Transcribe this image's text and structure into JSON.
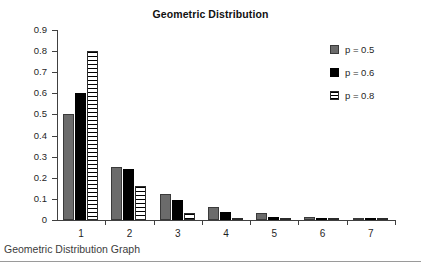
{
  "chart_data": {
    "type": "bar",
    "title": "Geometric Distribution",
    "xlabel": "",
    "ylabel": "",
    "categories": [
      "1",
      "2",
      "3",
      "4",
      "5",
      "6",
      "7"
    ],
    "series": [
      {
        "name": "p = 0.5",
        "color": "#6b6b6b",
        "pattern": "solid-gray",
        "values": [
          0.5,
          0.25,
          0.125,
          0.0625,
          0.031,
          0.016,
          0.008
        ]
      },
      {
        "name": "p = 0.6",
        "color": "#000000",
        "pattern": "solid-black",
        "values": [
          0.6,
          0.24,
          0.096,
          0.038,
          0.015,
          0.006,
          0.002
        ]
      },
      {
        "name": "p = 0.8",
        "color": "#ffffff",
        "pattern": "horizontal-stripes",
        "values": [
          0.8,
          0.16,
          0.032,
          0.0064,
          0.0013,
          0.0003,
          0.0001
        ]
      }
    ],
    "ylim": [
      0,
      0.9
    ],
    "ytick_labels": [
      "0.9",
      "0.8",
      "0.7",
      "0.6",
      "0.5",
      "0.4",
      "0.3",
      "0.2",
      "0.1",
      "0"
    ],
    "ytick_values": [
      0.9,
      0.8,
      0.7,
      0.6,
      0.5,
      0.4,
      0.3,
      0.2,
      0.1,
      0
    ],
    "grid": false,
    "legend_position": "right-top"
  },
  "caption": {
    "text": "Geometric Distribution Graph"
  }
}
